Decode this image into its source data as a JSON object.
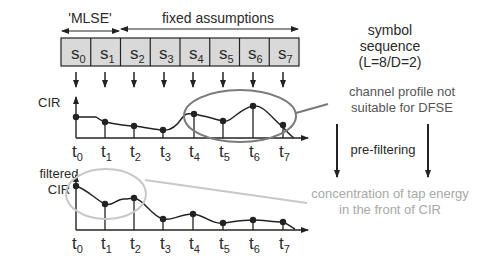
{
  "header": {
    "mlse_label": "'MLSE'",
    "fixed_label": "fixed assumptions"
  },
  "symbols": [
    {
      "base": "s",
      "sub": "0"
    },
    {
      "base": "s",
      "sub": "1"
    },
    {
      "base": "s",
      "sub": "2"
    },
    {
      "base": "s",
      "sub": "3"
    },
    {
      "base": "s",
      "sub": "4"
    },
    {
      "base": "s",
      "sub": "5"
    },
    {
      "base": "s",
      "sub": "6"
    },
    {
      "base": "s",
      "sub": "7"
    }
  ],
  "symbol_sequence": {
    "line1": "symbol",
    "line2": "sequence",
    "line3": "(L=8/D=2)"
  },
  "cir": {
    "label": "CIR",
    "annotation_line1": "channel profile not",
    "annotation_line2": "suitable for DFSE"
  },
  "prefilter": {
    "label": "pre-filtering"
  },
  "filtered_cir": {
    "label_line1": "filtered",
    "label_line2": "CIR",
    "annotation_line1": "concentration of tap energy",
    "annotation_line2": "in the front of CIR"
  },
  "ticks": [
    {
      "base": "t",
      "sub": "0"
    },
    {
      "base": "t",
      "sub": "1"
    },
    {
      "base": "t",
      "sub": "2"
    },
    {
      "base": "t",
      "sub": "3"
    },
    {
      "base": "t",
      "sub": "4"
    },
    {
      "base": "t",
      "sub": "5"
    },
    {
      "base": "t",
      "sub": "6"
    },
    {
      "base": "t",
      "sub": "7"
    }
  ],
  "colors": {
    "box_fill": "#d9d9d9",
    "stroke": "#222222",
    "ellipse_dark": "#7a7a7a",
    "ellipse_light": "#c8c8c8",
    "light_text": "#a8a8a8"
  }
}
